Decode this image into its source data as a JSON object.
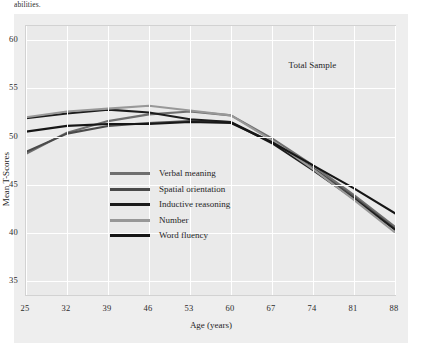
{
  "page": {
    "cropped_body_text": "abilities."
  },
  "figure": {
    "annotation": "Total Sample"
  },
  "chart_data": {
    "type": "line",
    "title": "",
    "annotation": "Total Sample",
    "xlabel": "Age (years)",
    "ylabel": "Mean T-Scores",
    "x": [
      25,
      32,
      39,
      46,
      53,
      60,
      67,
      74,
      81,
      88
    ],
    "xtick_labels": [
      "25",
      "32",
      "39",
      "46",
      "53",
      "60",
      "67",
      "74",
      "81",
      "88"
    ],
    "ytick_labels": [
      "35",
      "40",
      "45",
      "50",
      "55",
      "60"
    ],
    "yticks": [
      35,
      40,
      45,
      50,
      55,
      60
    ],
    "xlim": [
      25,
      88
    ],
    "ylim": [
      33.5,
      61.5
    ],
    "grid": true,
    "legend_position": "inside-lower-left",
    "series": [
      {
        "name": "Verbal meaning",
        "color": "#6f6f6f",
        "values": [
          48.2,
          50.4,
          51.6,
          52.3,
          52.6,
          52.2,
          49.8,
          47.0,
          43.9,
          40.6
        ]
      },
      {
        "name": "Spatial orientation",
        "color": "#4a4a4a",
        "values": [
          48.4,
          50.3,
          51.1,
          51.4,
          51.6,
          51.5,
          49.4,
          46.7,
          43.7,
          40.4
        ]
      },
      {
        "name": "Inductive reasoning",
        "color": "#1c1c1c",
        "values": [
          51.9,
          52.4,
          52.8,
          52.5,
          51.8,
          51.5,
          49.3,
          46.5,
          43.5,
          40.3
        ]
      },
      {
        "name": "Number",
        "color": "#989898",
        "values": [
          52.0,
          52.6,
          52.9,
          53.2,
          52.7,
          52.2,
          49.6,
          46.6,
          43.4,
          40.0
        ]
      },
      {
        "name": "Word fluency",
        "color": "#161616",
        "values": [
          50.5,
          51.1,
          51.3,
          51.3,
          51.5,
          51.4,
          49.4,
          47.0,
          44.6,
          42.0
        ]
      }
    ]
  }
}
